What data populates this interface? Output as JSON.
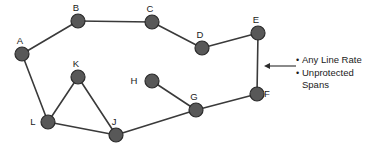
{
  "diagram": {
    "type": "network-topology",
    "canvas": {
      "width": 380,
      "height": 154
    },
    "node_radius": 7,
    "colors": {
      "node_fill": "#585858",
      "node_stroke": "#2b2b2b",
      "edge": "#3a3a3a",
      "text": "#1a1a1a",
      "background": "#ffffff"
    },
    "nodes": [
      {
        "id": "A",
        "label": "A",
        "x": 22,
        "y": 54,
        "label_dx": -2,
        "label_dy": -10
      },
      {
        "id": "B",
        "label": "B",
        "x": 78,
        "y": 21,
        "label_dx": -2,
        "label_dy": -10
      },
      {
        "id": "C",
        "label": "C",
        "x": 152,
        "y": 22,
        "label_dx": -2,
        "label_dy": -10
      },
      {
        "id": "D",
        "label": "D",
        "x": 202,
        "y": 48,
        "label_dx": -2,
        "label_dy": -10
      },
      {
        "id": "E",
        "label": "E",
        "x": 258,
        "y": 33,
        "label_dx": -2,
        "label_dy": -10
      },
      {
        "id": "F",
        "label": "F",
        "x": 257,
        "y": 94,
        "label_dx": 10,
        "label_dy": 3
      },
      {
        "id": "G",
        "label": "G",
        "x": 196,
        "y": 110,
        "label_dx": -2,
        "label_dy": -10
      },
      {
        "id": "H",
        "label": "H",
        "x": 152,
        "y": 81,
        "label_dx": -18,
        "label_dy": 3
      },
      {
        "id": "J",
        "label": "J",
        "x": 116,
        "y": 135,
        "label_dx": -2,
        "label_dy": -10
      },
      {
        "id": "K",
        "label": "K",
        "x": 78,
        "y": 77,
        "label_dx": -2,
        "label_dy": -10
      },
      {
        "id": "L",
        "label": "L",
        "x": 48,
        "y": 122,
        "label_dx": -15,
        "label_dy": 3
      }
    ],
    "edges": [
      {
        "from": "A",
        "to": "B"
      },
      {
        "from": "B",
        "to": "C"
      },
      {
        "from": "C",
        "to": "D"
      },
      {
        "from": "D",
        "to": "E"
      },
      {
        "from": "E",
        "to": "F"
      },
      {
        "from": "F",
        "to": "G"
      },
      {
        "from": "G",
        "to": "H"
      },
      {
        "from": "G",
        "to": "J"
      },
      {
        "from": "J",
        "to": "K"
      },
      {
        "from": "J",
        "to": "L"
      },
      {
        "from": "K",
        "to": "L"
      },
      {
        "from": "L",
        "to": "A"
      }
    ],
    "callout": {
      "arrow_tip_x": 264,
      "arrow_tip_y": 66,
      "arrow_tail_x": 296,
      "arrow_tail_y": 66
    }
  },
  "annotations": {
    "items": [
      {
        "bullet": "•",
        "text": "Any Line Rate"
      },
      {
        "bullet": "•",
        "text": "Unprotected Spans"
      }
    ]
  }
}
